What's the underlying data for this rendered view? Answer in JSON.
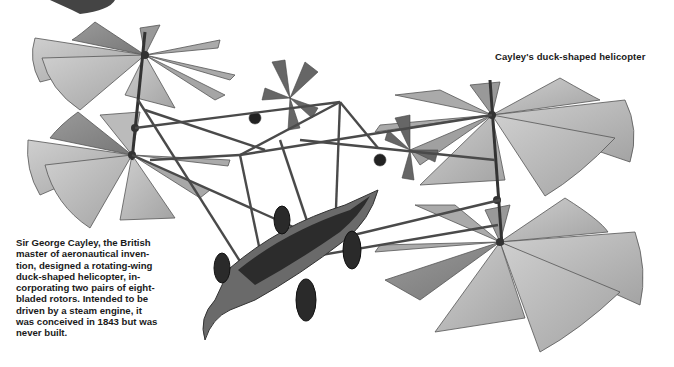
{
  "figure": {
    "title": "Cayley's duck-shaped helicopter",
    "illustration": "duck-shaped-helicopter-illustration",
    "colors": {
      "background": "#ffffff",
      "blade": "#b9b9b9",
      "blade_dark": "#8e8e8e",
      "frame": "#4a4a4a",
      "text": "#1a1a1a"
    }
  },
  "caption": {
    "lines": [
      "Sir George Cayley, the British",
      "master of aeronautical inven-",
      "tion, designed a rotating-wing",
      "duck-shaped helicopter, in-",
      "corporating two pairs of eight-",
      "bladed rotors. Intended to be",
      "driven by a steam engine, it",
      "was conceived in 1843 but was",
      "never built."
    ]
  }
}
